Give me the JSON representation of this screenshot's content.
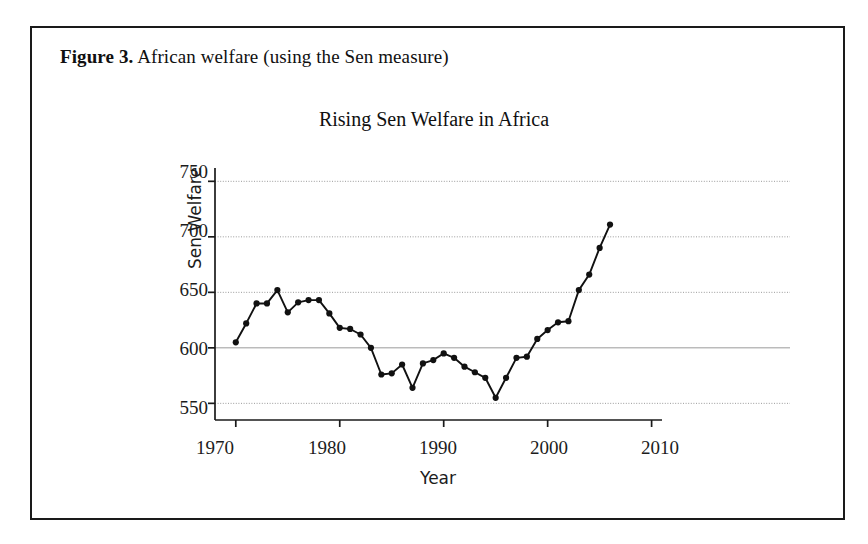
{
  "figure": {
    "caption_label": "Figure 3.",
    "caption_text": " African welfare (using the Sen measure)"
  },
  "chart_data": {
    "type": "line",
    "title": "Rising Sen Welfare in Africa",
    "xlabel": "Year",
    "ylabel": "Sen Welfare",
    "xlim": [
      1968,
      2011
    ],
    "ylim": [
      535,
      762
    ],
    "xticks": [
      1970,
      1980,
      1990,
      2000,
      2010
    ],
    "yticks": [
      550,
      600,
      650,
      700,
      750
    ],
    "grid": true,
    "grid_style": "dotted-horizontal",
    "legend": "none",
    "marker": "filled-circle",
    "line_color": "#111111",
    "x": [
      1970,
      1971,
      1972,
      1973,
      1974,
      1975,
      1976,
      1977,
      1978,
      1979,
      1980,
      1981,
      1982,
      1983,
      1984,
      1985,
      1986,
      1987,
      1988,
      1989,
      1990,
      1991,
      1992,
      1993,
      1994,
      1995,
      1996,
      1997,
      1998,
      1999,
      2000,
      2001,
      2002,
      2003,
      2004,
      2005,
      2006
    ],
    "values": [
      605,
      622,
      640,
      640,
      652,
      632,
      641,
      643,
      643,
      631,
      618,
      617,
      612,
      600,
      576,
      577,
      585,
      564,
      586,
      589,
      595,
      591,
      583,
      578,
      573,
      555,
      573,
      591,
      592,
      608,
      616,
      623,
      624,
      652,
      666,
      690,
      711
    ]
  },
  "axis": {
    "y_tick_labels": [
      "750",
      "700",
      "650",
      "600",
      "550"
    ],
    "x_tick_labels": [
      "1970",
      "1980",
      "1990",
      "2000",
      "2010"
    ]
  }
}
